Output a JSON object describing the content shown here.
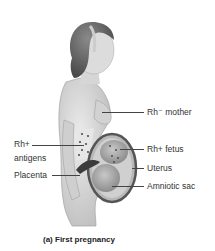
{
  "figure": {
    "labels": {
      "mother": "Rh⁻ mother",
      "antigens_line1": "Rh+",
      "antigens_line2": "antigens",
      "placenta": "Placenta",
      "fetus": "Rh+ fetus",
      "uterus": "Uterus",
      "amniotic_sac": "Amniotic sac"
    },
    "caption": "(a) First pregnancy",
    "colors": {
      "skin": "#d8d8d8",
      "hair": "#6a6a6a",
      "uterus_wall": "#555555",
      "fetus": "#a8a8a8",
      "antigen_dots": "#444444",
      "label_text": "#333333",
      "leader_line": "#444444"
    }
  }
}
